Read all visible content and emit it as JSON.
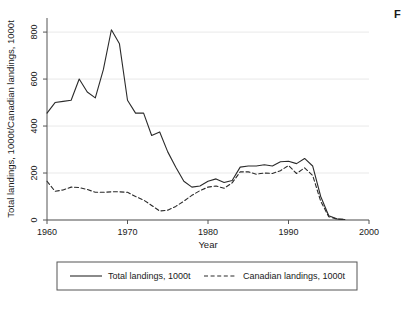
{
  "figure": {
    "background_color": "#ffffff",
    "line_color": "#2b2b2b",
    "grid_color": "#e9e9e9",
    "axis_color": "#555555",
    "caption_fragment": "F"
  },
  "chart_data": {
    "type": "line",
    "title": "",
    "xlabel": "Year",
    "ylabel": "Total landings, 1000t/Canadian landings, 1000t",
    "xlim": [
      1960,
      2000
    ],
    "ylim": [
      0,
      860
    ],
    "xticks": [
      1960,
      1970,
      1980,
      1990,
      2000
    ],
    "yticks": [
      0,
      200,
      400,
      600,
      800
    ],
    "grid": true,
    "grid_axis": "y",
    "legend_position": "below",
    "x": [
      1960,
      1961,
      1962,
      1963,
      1964,
      1965,
      1966,
      1967,
      1968,
      1969,
      1970,
      1971,
      1972,
      1973,
      1974,
      1975,
      1976,
      1977,
      1978,
      1979,
      1980,
      1981,
      1982,
      1983,
      1984,
      1985,
      1986,
      1987,
      1988,
      1989,
      1990,
      1991,
      1992,
      1993,
      1994,
      1995,
      1996,
      1997
    ],
    "series": [
      {
        "name": "Total landings, 1000t",
        "style": "solid",
        "color": "#2b2b2b",
        "values": [
          455,
          500,
          505,
          510,
          600,
          545,
          520,
          640,
          810,
          750,
          510,
          455,
          455,
          360,
          375,
          290,
          225,
          165,
          140,
          145,
          165,
          175,
          160,
          168,
          225,
          230,
          230,
          235,
          230,
          248,
          250,
          240,
          262,
          230,
          100,
          18,
          5,
          2
        ]
      },
      {
        "name": "Canadian landings, 1000t",
        "style": "dashed",
        "color": "#2b2b2b",
        "values": [
          165,
          122,
          128,
          140,
          138,
          130,
          118,
          118,
          120,
          120,
          118,
          100,
          85,
          62,
          38,
          42,
          58,
          80,
          105,
          125,
          140,
          145,
          135,
          158,
          205,
          205,
          195,
          200,
          198,
          210,
          232,
          198,
          222,
          190,
          80,
          14,
          4,
          2
        ]
      }
    ]
  },
  "legend": {
    "items": [
      {
        "label": "Total landings, 1000t",
        "style": "solid"
      },
      {
        "label": "Canadian landings, 1000t",
        "style": "dashed"
      }
    ]
  }
}
